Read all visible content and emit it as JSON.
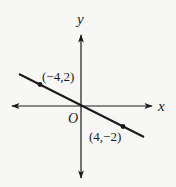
{
  "diagram": {
    "type": "coordinate-plane-line",
    "axes": {
      "x_label": "x",
      "y_label": "y",
      "origin_label": "O"
    },
    "line": {
      "passes_through_origin": true,
      "slope": -0.5
    },
    "points": [
      {
        "label": "(−4,2)",
        "x": -4,
        "y": 2
      },
      {
        "label": "(4,−2)",
        "x": 4,
        "y": -2
      }
    ],
    "colors": {
      "stroke": "#1a1a1a",
      "background": "#f7f7f5"
    }
  }
}
